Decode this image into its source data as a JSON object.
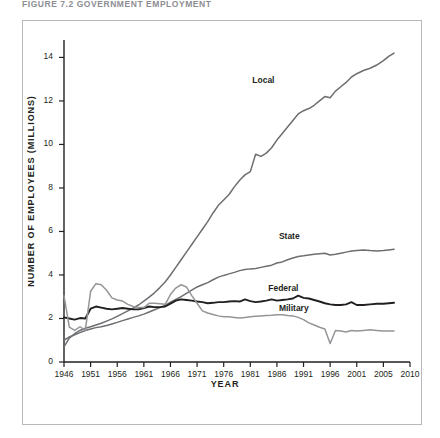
{
  "figure": {
    "title": "FIGURE 7.2   GOVERNMENT EMPLOYMENT"
  },
  "axes": {
    "y_title": "NUMBER OF EMPLOYEES (MILLIONS)",
    "x_title": "YEAR"
  },
  "series_labels": {
    "local": "Local",
    "state": "State",
    "federal": "Federal",
    "military": "Military"
  },
  "colors": {
    "local": "#6d6e71",
    "state": "#6d6e71",
    "federal": "#231f20",
    "military": "#939598",
    "frame": "#b9b9bd",
    "axis": "#231f20",
    "background": "#ffffff",
    "title": "#8d8d93"
  },
  "chart_data": {
    "type": "line",
    "title": "FIGURE 7.2   GOVERNMENT EMPLOYMENT",
    "xlabel": "YEAR",
    "ylabel": "NUMBER OF EMPLOYEES (MILLIONS)",
    "xlim": [
      1946,
      2010
    ],
    "ylim": [
      0,
      14.8
    ],
    "x_ticks": [
      1946,
      1951,
      1956,
      1961,
      1966,
      1971,
      1976,
      1981,
      1986,
      1991,
      1996,
      2001,
      2005,
      2010
    ],
    "y_ticks": [
      0,
      2,
      4,
      6,
      8,
      10,
      12,
      14
    ],
    "grid": false,
    "legend": "inline-labels",
    "series": [
      {
        "name": "Local",
        "color": "#6d6e71",
        "label_x": 1984,
        "label_y": 12.9,
        "points": [
          [
            1946,
            0.7
          ],
          [
            1947,
            1.1
          ],
          [
            1948,
            1.3
          ],
          [
            1949,
            1.45
          ],
          [
            1950,
            1.55
          ],
          [
            1951,
            1.62
          ],
          [
            1952,
            1.7
          ],
          [
            1953,
            1.78
          ],
          [
            1954,
            1.88
          ],
          [
            1955,
            1.98
          ],
          [
            1956,
            2.1
          ],
          [
            1957,
            2.22
          ],
          [
            1958,
            2.35
          ],
          [
            1959,
            2.48
          ],
          [
            1960,
            2.62
          ],
          [
            1961,
            2.8
          ],
          [
            1962,
            2.98
          ],
          [
            1963,
            3.18
          ],
          [
            1964,
            3.42
          ],
          [
            1965,
            3.68
          ],
          [
            1966,
            4.0
          ],
          [
            1967,
            4.35
          ],
          [
            1968,
            4.7
          ],
          [
            1969,
            5.05
          ],
          [
            1970,
            5.4
          ],
          [
            1971,
            5.75
          ],
          [
            1972,
            6.1
          ],
          [
            1973,
            6.45
          ],
          [
            1974,
            6.85
          ],
          [
            1975,
            7.2
          ],
          [
            1976,
            7.45
          ],
          [
            1977,
            7.7
          ],
          [
            1978,
            8.05
          ],
          [
            1979,
            8.35
          ],
          [
            1980,
            8.6
          ],
          [
            1981,
            8.75
          ],
          [
            1982,
            9.55
          ],
          [
            1983,
            9.45
          ],
          [
            1984,
            9.6
          ],
          [
            1985,
            9.85
          ],
          [
            1986,
            10.2
          ],
          [
            1987,
            10.5
          ],
          [
            1988,
            10.8
          ],
          [
            1989,
            11.1
          ],
          [
            1990,
            11.4
          ],
          [
            1991,
            11.55
          ],
          [
            1992,
            11.65
          ],
          [
            1993,
            11.8
          ],
          [
            1994,
            12.0
          ],
          [
            1995,
            12.2
          ],
          [
            1996,
            12.15
          ],
          [
            1997,
            12.45
          ],
          [
            1998,
            12.65
          ],
          [
            1999,
            12.85
          ],
          [
            2000,
            13.1
          ],
          [
            2001,
            13.25
          ],
          [
            2002,
            13.4
          ],
          [
            2003,
            13.5
          ],
          [
            2004,
            13.65
          ],
          [
            2005,
            13.85
          ],
          [
            2006,
            14.05
          ],
          [
            2007,
            14.2
          ]
        ]
      },
      {
        "name": "State",
        "color": "#6d6e71",
        "label_x": 1989,
        "label_y": 5.75,
        "points": [
          [
            1946,
            1.0
          ],
          [
            1947,
            1.15
          ],
          [
            1948,
            1.25
          ],
          [
            1949,
            1.35
          ],
          [
            1950,
            1.45
          ],
          [
            1951,
            1.52
          ],
          [
            1952,
            1.58
          ],
          [
            1953,
            1.62
          ],
          [
            1954,
            1.68
          ],
          [
            1955,
            1.75
          ],
          [
            1956,
            1.82
          ],
          [
            1957,
            1.9
          ],
          [
            1958,
            1.98
          ],
          [
            1959,
            2.05
          ],
          [
            1960,
            2.12
          ],
          [
            1961,
            2.2
          ],
          [
            1962,
            2.3
          ],
          [
            1963,
            2.4
          ],
          [
            1964,
            2.5
          ],
          [
            1965,
            2.6
          ],
          [
            1966,
            2.75
          ],
          [
            1967,
            2.88
          ],
          [
            1968,
            3.0
          ],
          [
            1969,
            3.15
          ],
          [
            1970,
            3.3
          ],
          [
            1971,
            3.45
          ],
          [
            1972,
            3.55
          ],
          [
            1973,
            3.65
          ],
          [
            1974,
            3.78
          ],
          [
            1975,
            3.9
          ],
          [
            1976,
            3.98
          ],
          [
            1977,
            4.05
          ],
          [
            1978,
            4.12
          ],
          [
            1979,
            4.2
          ],
          [
            1980,
            4.25
          ],
          [
            1981,
            4.28
          ],
          [
            1982,
            4.3
          ],
          [
            1983,
            4.35
          ],
          [
            1984,
            4.4
          ],
          [
            1985,
            4.45
          ],
          [
            1986,
            4.55
          ],
          [
            1987,
            4.6
          ],
          [
            1988,
            4.7
          ],
          [
            1989,
            4.78
          ],
          [
            1990,
            4.85
          ],
          [
            1991,
            4.88
          ],
          [
            1992,
            4.92
          ],
          [
            1993,
            4.95
          ],
          [
            1994,
            4.98
          ],
          [
            1995,
            5.0
          ],
          [
            1996,
            4.92
          ],
          [
            1997,
            4.95
          ],
          [
            1998,
            5.0
          ],
          [
            1999,
            5.05
          ],
          [
            2000,
            5.1
          ],
          [
            2001,
            5.12
          ],
          [
            2002,
            5.15
          ],
          [
            2003,
            5.12
          ],
          [
            2004,
            5.1
          ],
          [
            2005,
            5.12
          ],
          [
            2006,
            5.15
          ],
          [
            2007,
            5.18
          ]
        ]
      },
      {
        "name": "Federal",
        "color": "#231f20",
        "label_x": 1987,
        "label_y": 3.35,
        "points": [
          [
            1946,
            2.05
          ],
          [
            1947,
            2.0
          ],
          [
            1948,
            1.95
          ],
          [
            1949,
            2.02
          ],
          [
            1950,
            2.0
          ],
          [
            1951,
            2.45
          ],
          [
            1952,
            2.55
          ],
          [
            1953,
            2.5
          ],
          [
            1954,
            2.45
          ],
          [
            1955,
            2.42
          ],
          [
            1956,
            2.45
          ],
          [
            1957,
            2.48
          ],
          [
            1958,
            2.45
          ],
          [
            1959,
            2.42
          ],
          [
            1960,
            2.42
          ],
          [
            1961,
            2.48
          ],
          [
            1962,
            2.55
          ],
          [
            1963,
            2.52
          ],
          [
            1964,
            2.52
          ],
          [
            1965,
            2.55
          ],
          [
            1966,
            2.68
          ],
          [
            1967,
            2.82
          ],
          [
            1968,
            2.88
          ],
          [
            1969,
            2.85
          ],
          [
            1970,
            2.82
          ],
          [
            1971,
            2.78
          ],
          [
            1972,
            2.75
          ],
          [
            1973,
            2.7
          ],
          [
            1974,
            2.72
          ],
          [
            1975,
            2.75
          ],
          [
            1976,
            2.75
          ],
          [
            1977,
            2.78
          ],
          [
            1978,
            2.8
          ],
          [
            1979,
            2.78
          ],
          [
            1980,
            2.88
          ],
          [
            1981,
            2.8
          ],
          [
            1982,
            2.75
          ],
          [
            1983,
            2.78
          ],
          [
            1984,
            2.82
          ],
          [
            1985,
            2.88
          ],
          [
            1986,
            2.82
          ],
          [
            1987,
            2.85
          ],
          [
            1988,
            2.88
          ],
          [
            1989,
            2.92
          ],
          [
            1990,
            3.05
          ],
          [
            1991,
            2.95
          ],
          [
            1992,
            2.92
          ],
          [
            1993,
            2.85
          ],
          [
            1994,
            2.78
          ],
          [
            1995,
            2.7
          ],
          [
            1996,
            2.65
          ],
          [
            1997,
            2.62
          ],
          [
            1998,
            2.62
          ],
          [
            1999,
            2.65
          ],
          [
            2000,
            2.75
          ],
          [
            2001,
            2.62
          ],
          [
            2002,
            2.62
          ],
          [
            2003,
            2.65
          ],
          [
            2004,
            2.68
          ],
          [
            2005,
            2.68
          ],
          [
            2006,
            2.7
          ],
          [
            2007,
            2.72
          ]
        ]
      },
      {
        "name": "Military",
        "color": "#939598",
        "label_x": 1989,
        "label_y": 2.45,
        "points": [
          [
            1946,
            3.05
          ],
          [
            1947,
            1.6
          ],
          [
            1948,
            1.45
          ],
          [
            1949,
            1.62
          ],
          [
            1950,
            1.45
          ],
          [
            1951,
            3.25
          ],
          [
            1952,
            3.6
          ],
          [
            1953,
            3.55
          ],
          [
            1954,
            3.3
          ],
          [
            1955,
            2.95
          ],
          [
            1956,
            2.85
          ],
          [
            1957,
            2.8
          ],
          [
            1958,
            2.65
          ],
          [
            1959,
            2.55
          ],
          [
            1960,
            2.5
          ],
          [
            1961,
            2.5
          ],
          [
            1962,
            2.7
          ],
          [
            1963,
            2.7
          ],
          [
            1964,
            2.68
          ],
          [
            1965,
            2.65
          ],
          [
            1966,
            3.1
          ],
          [
            1967,
            3.4
          ],
          [
            1968,
            3.55
          ],
          [
            1969,
            3.45
          ],
          [
            1970,
            3.05
          ],
          [
            1971,
            2.7
          ],
          [
            1972,
            2.35
          ],
          [
            1973,
            2.25
          ],
          [
            1974,
            2.18
          ],
          [
            1975,
            2.12
          ],
          [
            1976,
            2.08
          ],
          [
            1977,
            2.08
          ],
          [
            1978,
            2.05
          ],
          [
            1979,
            2.02
          ],
          [
            1980,
            2.05
          ],
          [
            1981,
            2.08
          ],
          [
            1982,
            2.1
          ],
          [
            1983,
            2.12
          ],
          [
            1984,
            2.14
          ],
          [
            1985,
            2.15
          ],
          [
            1986,
            2.17
          ],
          [
            1987,
            2.17
          ],
          [
            1988,
            2.14
          ],
          [
            1989,
            2.12
          ],
          [
            1990,
            2.05
          ],
          [
            1991,
            1.95
          ],
          [
            1992,
            1.8
          ],
          [
            1993,
            1.7
          ],
          [
            1994,
            1.6
          ],
          [
            1995,
            1.52
          ],
          [
            1996,
            0.85
          ],
          [
            1997,
            1.45
          ],
          [
            1998,
            1.42
          ],
          [
            1999,
            1.38
          ],
          [
            2000,
            1.45
          ],
          [
            2001,
            1.42
          ],
          [
            2002,
            1.45
          ],
          [
            2003,
            1.48
          ],
          [
            2004,
            1.45
          ],
          [
            2005,
            1.42
          ],
          [
            2006,
            1.42
          ],
          [
            2007,
            1.43
          ]
        ]
      }
    ]
  }
}
